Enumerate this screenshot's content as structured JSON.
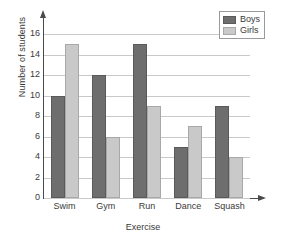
{
  "chart_data": {
    "type": "bar",
    "title": "",
    "xlabel": "Exercise",
    "ylabel": "Number of students",
    "categories": [
      "Swim",
      "Gym",
      "Run",
      "Dance",
      "Squash"
    ],
    "series": [
      {
        "name": "Boys",
        "color": "#6e6e6e",
        "values": [
          10,
          12,
          15,
          5,
          9
        ]
      },
      {
        "name": "Girls",
        "color": "#c9c9c9",
        "values": [
          15,
          6,
          9,
          7,
          4
        ]
      }
    ],
    "ylim": [
      0,
      17
    ],
    "yticks": [
      0,
      2,
      4,
      6,
      8,
      10,
      12,
      14,
      16
    ],
    "ytick_labels": [
      "0",
      "2",
      "4",
      "6",
      "8",
      "10",
      "12",
      "14",
      "16"
    ],
    "grid": "horizontal",
    "legend_position": "top-right",
    "axis_arrows": {
      "y": "up-arrow-icon",
      "x": "right-arrow-icon"
    }
  }
}
